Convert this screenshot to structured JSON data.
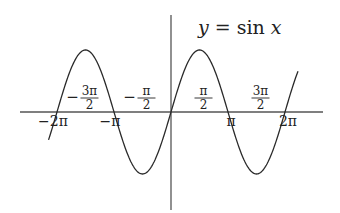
{
  "chart_data": {
    "type": "line",
    "title": "y = sin x",
    "title_parts": {
      "lhs": "y",
      "eq": " = ",
      "fn": "sin",
      "var": "x"
    },
    "xlabel": "",
    "ylabel": "",
    "function": "sin(x)",
    "x_range": [
      -6.75,
      7.0
    ],
    "xlim": [
      -8.0,
      8.4
    ],
    "ylim": [
      -1.6,
      1.6
    ],
    "grid": false,
    "series": [
      {
        "name": "sin x",
        "x": [
          -6.75,
          -6.2832,
          -5.4978,
          -4.7124,
          -3.927,
          -3.1416,
          -2.3562,
          -1.5708,
          -0.7854,
          0,
          0.7854,
          1.5708,
          2.3562,
          3.1416,
          3.927,
          4.7124,
          5.4978,
          6.2832,
          7.0
        ],
        "values": [
          -0.45,
          0,
          0.707,
          1,
          0.707,
          0,
          -0.707,
          -1,
          -0.707,
          0,
          0.707,
          1,
          0.707,
          0,
          -0.707,
          -1,
          -0.707,
          0,
          0.657
        ]
      }
    ],
    "tick_labels_below": [
      {
        "label": "−2π",
        "x": -6.2832
      },
      {
        "label": "−π",
        "x": -3.1416
      },
      {
        "label": "π",
        "x": 3.1416
      },
      {
        "label": "2π",
        "x": 6.2832
      }
    ],
    "tick_labels_above": [
      {
        "sign": "−",
        "num": "3π",
        "den": "2",
        "x": -4.7124
      },
      {
        "sign": "−",
        "num": "π",
        "den": "2",
        "x": -1.5708
      },
      {
        "sign": "",
        "num": "π",
        "den": "2",
        "x": 1.5708
      },
      {
        "sign": "",
        "num": "3π",
        "den": "2",
        "x": 4.7124
      }
    ],
    "colors": {
      "curve": "#2a2a2a",
      "axes": "#555555",
      "text": "#222222",
      "background": "#ffffff"
    }
  }
}
